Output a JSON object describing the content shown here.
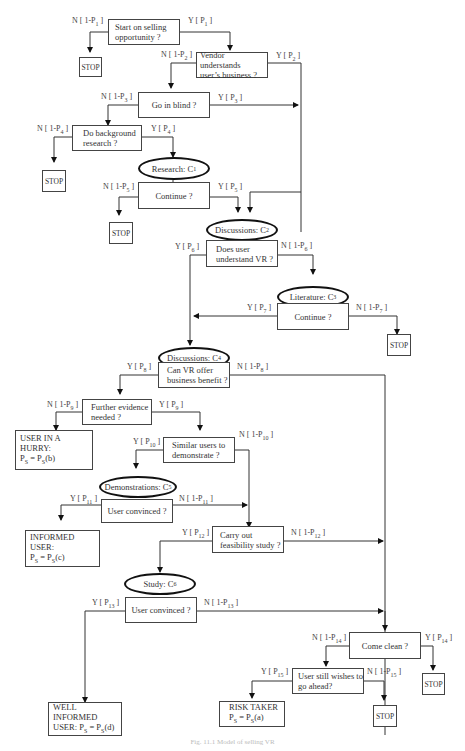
{
  "nodes": {
    "start": {
      "line1": "Start on selling",
      "line2": "opportunity ?"
    },
    "vendor": {
      "line1": "Vendor  understands",
      "line2": "user’s business ?"
    },
    "blind": {
      "text": "Go in blind ?"
    },
    "background": {
      "line1": "Do background",
      "line2": "research ?"
    },
    "research": {
      "text": "Research:  C",
      "sub": "1"
    },
    "continue1": {
      "text": "Continue ?"
    },
    "discussions2": {
      "text": "Discussions:  C",
      "sub": "2"
    },
    "understand": {
      "line1": "Does user",
      "line2": "understand VR ?"
    },
    "literature": {
      "text": "Literature:  C",
      "sub": "3"
    },
    "continue2": {
      "text": "Continue ?"
    },
    "discussions4": {
      "text": "Discussions:  C",
      "sub": "4"
    },
    "benefit": {
      "line1": "Can VR offer",
      "line2": "business benefit ?"
    },
    "evidence": {
      "line1": "Further evidence",
      "line2": "needed ?"
    },
    "hurry": {
      "line1": "USER IN A HURRY:",
      "line2": "P",
      "line2_sub": "S",
      "line2_rest": " = P",
      "line2_sub2": "S",
      "line2_end": "(b)"
    },
    "similar": {
      "line1": "Similar  users to",
      "line2": "demonstrate ?"
    },
    "demonstrations": {
      "text": "Demonstrations: C",
      "sub": "5"
    },
    "convinced1": {
      "text": "User convinced ?"
    },
    "informed": {
      "line1": "INFORMED USER:",
      "line2": "P",
      "line2_sub": "S",
      "line2_rest": " = P",
      "line2_sub2": "S",
      "line2_end": "(c)"
    },
    "feasibility": {
      "line1": "Carry out",
      "line2": "feasibility study ?"
    },
    "study": {
      "text": "Study:  C",
      "sub": "6"
    },
    "convinced2": {
      "text": "User convinced ?"
    },
    "wellinformed": {
      "line1": "WELL INFORMED",
      "line2": "USER:   P",
      "line2_sub": "S",
      "line2_rest": " = P",
      "line2_sub2": "S",
      "line2_end": "(d)"
    },
    "comeclean": {
      "text": "Come clean ?"
    },
    "stillwishes": {
      "line1": "User still wishes to",
      "line2": "go ahead?"
    },
    "risktaker": {
      "line1": "RISK TAKER",
      "line2": "P",
      "line2_sub": "S",
      "line2_rest": " = P",
      "line2_sub2": "S",
      "line2_end": "(a)"
    },
    "stop_label": "STOP"
  },
  "edges": {
    "n1": {
      "t": "N [ 1-P",
      "s": "1",
      "e": " ]"
    },
    "y1": {
      "t": "Y [ P",
      "s": "1",
      "e": " ]"
    },
    "n2": {
      "t": "N [ 1-P",
      "s": "2",
      "e": " ]"
    },
    "y2": {
      "t": "Y [ P",
      "s": "2",
      "e": " ]"
    },
    "n3": {
      "t": "N [ 1-P",
      "s": "3",
      "e": " ]"
    },
    "y3": {
      "t": "Y [ P",
      "s": "3",
      "e": " ]"
    },
    "n4": {
      "t": "N [ 1-P",
      "s": "4",
      "e": " ]"
    },
    "y4": {
      "t": "Y [ P",
      "s": "4",
      "e": " ]"
    },
    "n5": {
      "t": "N [ 1-P",
      "s": "5",
      "e": " ]"
    },
    "y5": {
      "t": "Y [ P",
      "s": "5",
      "e": " ]"
    },
    "y6": {
      "t": "Y [ P",
      "s": "6",
      "e": " ]"
    },
    "n6": {
      "t": "N [ 1-P",
      "s": "6",
      "e": " ]"
    },
    "y7": {
      "t": "Y [ P",
      "s": "7",
      "e": " ]"
    },
    "n7": {
      "t": "N [ 1-P",
      "s": "7",
      "e": " ]"
    },
    "y8": {
      "t": "Y [ P",
      "s": "8",
      "e": " ]"
    },
    "n8": {
      "t": "N [ 1-P",
      "s": "8",
      "e": " ]"
    },
    "n9": {
      "t": "N [ 1-P",
      "s": "9",
      "e": " ]"
    },
    "y9": {
      "t": "Y [ P",
      "s": "9",
      "e": " ]"
    },
    "y10": {
      "t": "Y [ P",
      "s": "10",
      "e": " ]"
    },
    "n10": {
      "t": "N [ 1-P",
      "s": "10",
      "e": " ]"
    },
    "y11": {
      "t": "Y [ P",
      "s": "11",
      "e": " ]"
    },
    "n11": {
      "t": "N [ 1-P",
      "s": "11",
      "e": " ]"
    },
    "y12": {
      "t": "Y [ P",
      "s": "12",
      "e": " ]"
    },
    "n12": {
      "t": "N [ 1-P",
      "s": "12",
      "e": " ]"
    },
    "y13": {
      "t": "Y [ P",
      "s": "13",
      "e": " ]"
    },
    "n13": {
      "t": "N [ 1-P",
      "s": "13",
      "e": " ]"
    },
    "n14": {
      "t": "N [ 1-P",
      "s": "14",
      "e": " ]"
    },
    "y14": {
      "t": "Y [ P",
      "s": "14",
      "e": " ]"
    },
    "y15": {
      "t": "Y [ P",
      "s": "15",
      "e": " ]"
    },
    "n15": {
      "t": "N [ 1-P",
      "s": "15",
      "e": " ]"
    }
  },
  "caption": "Fig. 11.1  Model of selling VR"
}
